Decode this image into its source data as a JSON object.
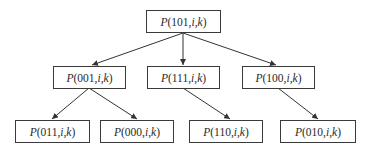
{
  "diagram": {
    "type": "tree",
    "line_color": "#333333",
    "nodes": [
      {
        "id": "n101",
        "fn": "P",
        "code": "101",
        "vars": [
          "i",
          "k"
        ],
        "level": 0
      },
      {
        "id": "n001",
        "fn": "P",
        "code": "001",
        "vars": [
          "i",
          "k"
        ],
        "level": 1
      },
      {
        "id": "n111",
        "fn": "P",
        "code": "111",
        "vars": [
          "i",
          "k"
        ],
        "level": 1
      },
      {
        "id": "n100",
        "fn": "P",
        "code": "100",
        "vars": [
          "i",
          "k"
        ],
        "level": 1
      },
      {
        "id": "n011",
        "fn": "P",
        "code": "011",
        "vars": [
          "i",
          "k"
        ],
        "level": 2
      },
      {
        "id": "n000",
        "fn": "P",
        "code": "000",
        "vars": [
          "i",
          "k"
        ],
        "level": 2
      },
      {
        "id": "n110",
        "fn": "P",
        "code": "110",
        "vars": [
          "i",
          "k"
        ],
        "level": 2
      },
      {
        "id": "n010",
        "fn": "P",
        "code": "010",
        "vars": [
          "i",
          "k"
        ],
        "level": 2
      }
    ],
    "edges": [
      [
        "n101",
        "n001"
      ],
      [
        "n101",
        "n111"
      ],
      [
        "n101",
        "n100"
      ],
      [
        "n001",
        "n011"
      ],
      [
        "n001",
        "n000"
      ],
      [
        "n111",
        "n110"
      ],
      [
        "n100",
        "n010"
      ]
    ]
  }
}
